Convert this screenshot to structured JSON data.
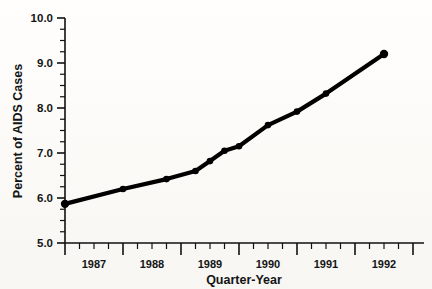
{
  "chart_data": {
    "type": "line",
    "title": "",
    "xlabel": "Quarter-Year",
    "ylabel": "Percent of AIDS Cases",
    "ylim": [
      5.0,
      10.0
    ],
    "ytick_labels": [
      "5.0",
      "6.0",
      "7.0",
      "8.0",
      "9.0",
      "10.0"
    ],
    "ytick_values": [
      5.0,
      6.0,
      7.0,
      8.0,
      9.0,
      10.0
    ],
    "yminor_step": 0.25,
    "grid": false,
    "legend": null,
    "xtick_labels": [
      "1987",
      "1988",
      "1989",
      "1990",
      "1991",
      "1992"
    ],
    "xtick_values": [
      1987,
      1988,
      1989,
      1990,
      1991,
      1992
    ],
    "xlim": [
      1986.75,
      1993.0
    ],
    "x_minor_label": "quarters",
    "marker": "filled-circle",
    "line_color": "#000000",
    "series": [
      {
        "name": "Percent of AIDS Cases",
        "x": [
          1987.0,
          1988.0,
          1988.75,
          1989.25,
          1989.5,
          1989.75,
          1990.0,
          1990.5,
          1991.0,
          1991.5,
          1992.5
        ],
        "values": [
          5.87,
          6.2,
          6.42,
          6.6,
          6.82,
          7.05,
          7.15,
          7.62,
          7.92,
          8.32,
          9.2
        ]
      }
    ]
  },
  "axes": {
    "x_axis_label": "Quarter-Year",
    "y_axis_label": "Percent of AIDS Cases"
  }
}
